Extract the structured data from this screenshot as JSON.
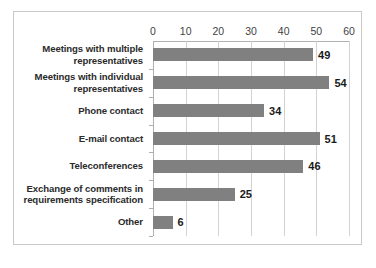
{
  "chart_data": {
    "type": "bar",
    "orientation": "horizontal",
    "title": "",
    "subtitle": "",
    "xlabel": "",
    "ylabel": "",
    "xlim": [
      0,
      60
    ],
    "ylim": null,
    "grid": true,
    "legend": null,
    "legend_position": "none",
    "xticks": [
      "0",
      "10",
      "20",
      "30",
      "40",
      "50",
      "60"
    ],
    "xtick_values": [
      0,
      10,
      20,
      30,
      40,
      50,
      60
    ],
    "bar_color": "#808080",
    "gridline_color": "#d2d2d2",
    "axis_color": "#b0b0b0",
    "border_color": "#c9c9c9",
    "label_color": "#2b2b2b",
    "value_label_color": "#1a1a1a",
    "categories": [
      "Meetings with multiple representatives",
      "Meetings with individual representatives",
      "Phone contact",
      "E-mail contact",
      "Teleconferences",
      "Exchange of comments in requirements specification",
      "Other"
    ],
    "values": [
      49,
      54,
      34,
      51,
      46,
      25,
      6
    ],
    "data_labels": [
      "49",
      "54",
      "34",
      "51",
      "46",
      "25",
      "6"
    ],
    "series": [
      {
        "name": "",
        "values": [
          49,
          54,
          34,
          51,
          46,
          25,
          6
        ]
      }
    ]
  }
}
